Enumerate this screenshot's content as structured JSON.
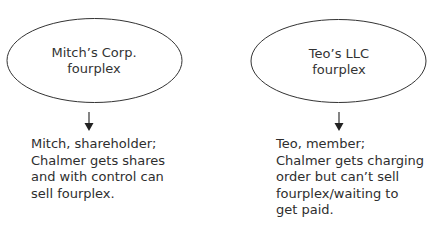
{
  "nodes": [
    {
      "id": "mitch",
      "label_lines": [
        "Mitch’s Corp.",
        "fourplex"
      ],
      "note_lines": [
        "Mitch, shareholder;",
        "Chalmer gets shares",
        "and with control can",
        "sell fourplex."
      ]
    },
    {
      "id": "teo",
      "label_lines": [
        "Teo’s LLC",
        "fourplex"
      ],
      "note_lines": [
        "Teo, member;",
        "Chalmer gets charging",
        "order but can’t sell",
        "fourplex/waiting to",
        "get paid."
      ]
    }
  ],
  "colors": {
    "stroke": "#333333",
    "text": "#2e2e2e",
    "background": "#ffffff"
  }
}
